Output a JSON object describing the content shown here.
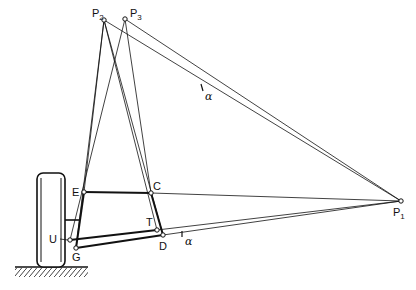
{
  "diagram": {
    "type": "suspension-geometry",
    "points": {
      "P1": {
        "label": "P",
        "sub": "1"
      },
      "P2": {
        "label": "P",
        "sub": "2"
      },
      "P3": {
        "label": "P",
        "sub": "3"
      },
      "E": {
        "label": "E"
      },
      "C": {
        "label": "C"
      },
      "T": {
        "label": "T"
      },
      "D": {
        "label": "D"
      },
      "U": {
        "label": "U"
      },
      "G": {
        "label": "G"
      }
    },
    "angle_labels": [
      "α",
      "α"
    ],
    "colors": {
      "ink": "#111111",
      "background": "#ffffff"
    }
  }
}
